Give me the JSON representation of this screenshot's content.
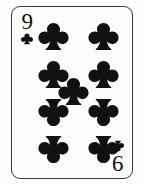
{
  "card": {
    "name": "Nine of Clubs",
    "rank": "9",
    "rank_inverted_display": "6",
    "suit": "clubs",
    "suit_symbol": "♣",
    "pip_count": 9,
    "colors": {
      "ink": "#111111",
      "border": "#3a3a3a",
      "face": "#fdfdfd",
      "background": "#ffffff"
    },
    "indices": [
      {
        "position": "top-left",
        "rank": "9",
        "suit": "club-icon"
      },
      {
        "position": "bottom-right",
        "rank": "9",
        "suit": "club-icon"
      }
    ],
    "pips": [
      {
        "id": "pip-1",
        "column": "left",
        "row": 1,
        "inverted": false
      },
      {
        "id": "pip-2",
        "column": "right",
        "row": 1,
        "inverted": false
      },
      {
        "id": "pip-3",
        "column": "left",
        "row": 2,
        "inverted": false
      },
      {
        "id": "pip-4",
        "column": "right",
        "row": 2,
        "inverted": false
      },
      {
        "id": "pip-5",
        "column": "center",
        "row": 0,
        "inverted": false
      },
      {
        "id": "pip-6",
        "column": "left",
        "row": 3,
        "inverted": true
      },
      {
        "id": "pip-7",
        "column": "right",
        "row": 3,
        "inverted": true
      },
      {
        "id": "pip-8",
        "column": "left",
        "row": 4,
        "inverted": true
      },
      {
        "id": "pip-9",
        "column": "right",
        "row": 4,
        "inverted": true
      }
    ]
  }
}
